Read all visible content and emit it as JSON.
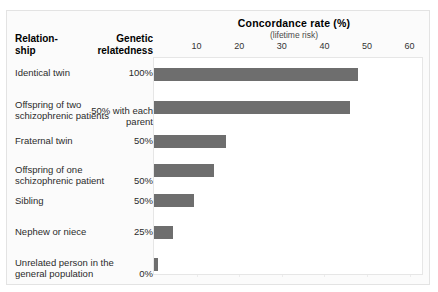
{
  "chart_data": {
    "type": "bar",
    "orientation": "horizontal",
    "title": "Concordance rate (%)",
    "subtitle": "(lifetime risk)",
    "xlabel": "Concordance rate (%)",
    "ylabel": "Relationship",
    "xlim": [
      0,
      62
    ],
    "xticks": [
      10,
      20,
      30,
      40,
      50,
      60
    ],
    "grid": true,
    "legend": null,
    "bar_color": "#6e6e6e",
    "columns": [
      "Relation-\nship",
      "Genetic\nrelatedness",
      "Concordance rate (%)"
    ],
    "categories": [
      "Identical twin",
      "Offspring of two schizophrenic patients",
      "Fraternal twin",
      "Offspring of one schizophrenic patient",
      "Sibling",
      "Nephew or niece",
      "Unrelated person in the general population"
    ],
    "values": [
      48,
      46,
      17,
      14,
      9.5,
      4.5,
      1
    ],
    "relatedness": [
      "100%",
      "50% with each parent",
      "50%",
      "50%",
      "50%",
      "25%",
      "0%"
    ]
  },
  "header": {
    "relationship": "Relation-\nship",
    "relationship_line1": "Relation-",
    "relationship_line2": "ship",
    "relatedness_line1": "Genetic",
    "relatedness_line2": "relatedness",
    "title": "Concordance rate (%)",
    "subtitle": "(lifetime risk)"
  },
  "axis": {
    "ticks": [
      {
        "label": "10",
        "value": 10
      },
      {
        "label": "20",
        "value": 20
      },
      {
        "label": "30",
        "value": 30
      },
      {
        "label": "40",
        "value": 40
      },
      {
        "label": "50",
        "value": 50
      },
      {
        "label": "60",
        "value": 60
      }
    ]
  },
  "rows": [
    {
      "label": "Identical twin",
      "relatedness": "100%",
      "value": 48
    },
    {
      "label": "Offspring of two schizophrenic patients",
      "relatedness": "50% with each parent",
      "value": 46
    },
    {
      "label": "Fraternal twin",
      "relatedness": "50%",
      "value": 17
    },
    {
      "label": "Offspring of one schizophrenic patient",
      "relatedness": "50%",
      "value": 14
    },
    {
      "label": "Sibling",
      "relatedness": "50%",
      "value": 9.5
    },
    {
      "label": "Nephew or niece",
      "relatedness": "25%",
      "value": 4.5
    },
    {
      "label": "Unrelated person in the general population",
      "relatedness": "0%",
      "value": 1
    }
  ]
}
